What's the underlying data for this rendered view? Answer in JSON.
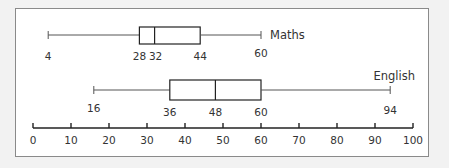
{
  "chart_data": {
    "type": "boxplot",
    "title": "",
    "xlabel": "",
    "ylabel": "",
    "xlim": [
      0,
      100
    ],
    "x_ticks": [
      0,
      10,
      20,
      30,
      40,
      50,
      60,
      70,
      80,
      90,
      100
    ],
    "x_tick_labels": [
      "0",
      "10",
      "20",
      "30",
      "40",
      "50",
      "60",
      "70",
      "80",
      "90",
      "100"
    ],
    "grid": false,
    "legend": null,
    "series": [
      {
        "name": "Maths",
        "min": 4,
        "q1": 28,
        "median": 32,
        "q3": 44,
        "max": 60
      },
      {
        "name": "English",
        "min": 16,
        "q1": 36,
        "median": 48,
        "q3": 60,
        "max": 94
      }
    ]
  },
  "labels": {
    "maths": {
      "name": "Maths",
      "min": "4",
      "q1": "28",
      "median": "32",
      "q3": "44",
      "max": "60"
    },
    "english": {
      "name": "English",
      "min": "16",
      "q1": "36",
      "median": "48",
      "q3": "60",
      "max": "94"
    },
    "axis": [
      "0",
      "10",
      "20",
      "30",
      "40",
      "50",
      "60",
      "70",
      "80",
      "90",
      "100"
    ]
  }
}
